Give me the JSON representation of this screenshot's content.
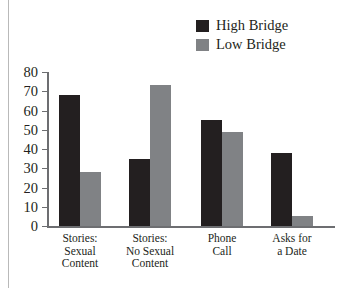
{
  "figure": {
    "background": "#ffffff",
    "axis_color": "#6d6e71"
  },
  "legend": {
    "position": "top-right",
    "entries": [
      {
        "label": "High Bridge",
        "color": "#231f20",
        "swatch_name": "legend-swatch-high-bridge"
      },
      {
        "label": "Low Bridge",
        "color": "#808285",
        "swatch_name": "legend-swatch-low-bridge"
      }
    ]
  },
  "axis": {
    "y_ticks": [
      "80",
      "70",
      "60",
      "50",
      "40",
      "30",
      "20",
      "10",
      "0"
    ]
  },
  "chart_data": {
    "type": "bar",
    "title": "",
    "xlabel": "",
    "ylabel": "",
    "ylim": [
      0,
      80
    ],
    "ytick_interval": 10,
    "grid": false,
    "legend_position": "top-right",
    "categories": [
      "Stories:\nSexual\nContent",
      "Stories:\nNo Sexual\nContent",
      "Phone\nCall",
      "Asks for\na Date"
    ],
    "series": [
      {
        "name": "High Bridge",
        "color": "#231f20",
        "values": [
          68,
          35,
          55,
          38
        ]
      },
      {
        "name": "Low Bridge",
        "color": "#808285",
        "values": [
          28,
          73,
          49,
          5
        ]
      }
    ]
  }
}
